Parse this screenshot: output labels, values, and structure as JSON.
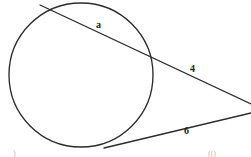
{
  "figure": {
    "kind": "circle-secant-tangent-diagram",
    "width": 251,
    "height": 157,
    "background_color": "#ffffff",
    "stroke_color": "#2b2b2f",
    "label_color": "#1d1d21"
  },
  "circle": {
    "name": "circle",
    "center_x": 81,
    "center_y": 75,
    "radius": 72
  },
  "secant_line": {
    "name": "secant",
    "from_x": 40,
    "from_y": 5,
    "to_x": 251,
    "to_y": 104,
    "chord_label": "a",
    "external_label": "4"
  },
  "tangent_line": {
    "name": "tangent",
    "from_x": 104,
    "from_y": 148,
    "to_x": 251,
    "to_y": 113,
    "label": "6",
    "touch_x": 110,
    "touch_y": 147
  },
  "labels": {
    "chord_a": "a",
    "secant_external_4": "4",
    "tangent_6": "6"
  },
  "edge_artifacts": {
    "bottom_left": ")",
    "bottom_right": "(()"
  }
}
